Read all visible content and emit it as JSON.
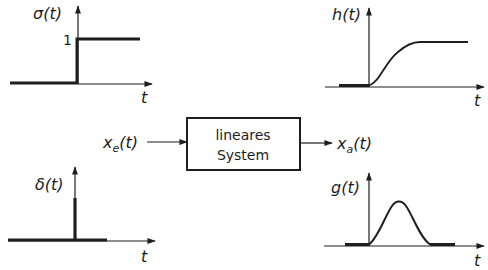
{
  "diagram": {
    "system_block": {
      "line1": "lineares",
      "line2": "System"
    },
    "input_label": "x_e(t)",
    "input_main": "x",
    "input_sub": "e",
    "input_arg": "(t)",
    "output_label": "x_a(t)",
    "output_main": "x",
    "output_sub": "a",
    "output_arg": "(t)",
    "plots": [
      {
        "id": "step-input",
        "label": "σ(t)",
        "axis": "t",
        "level_marker": "1",
        "shape": "unit-step"
      },
      {
        "id": "step-response",
        "label": "h(t)",
        "axis": "t",
        "shape": "s-curve-rise-to-constant"
      },
      {
        "id": "impulse-input",
        "label": "δ(t)",
        "axis": "t",
        "shape": "dirac-impulse"
      },
      {
        "id": "impulse-response",
        "label": "g(t)",
        "axis": "t",
        "shape": "bell-shaped-pulse"
      }
    ],
    "colors": {
      "ink": "#1e1e1e",
      "background": "#ffffff"
    }
  }
}
